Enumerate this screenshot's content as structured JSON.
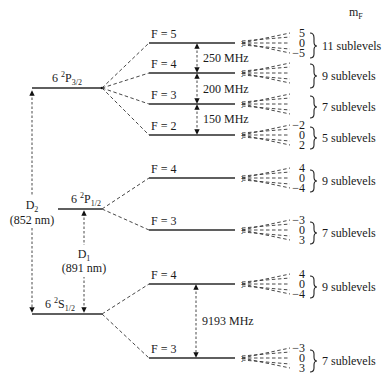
{
  "diagram": {
    "mf_header": "m",
    "mf_header_sub": "F",
    "fine_levels": {
      "p32": {
        "n": "6",
        "sup": "2",
        "L": "P",
        "sub": "3/2"
      },
      "p12": {
        "n": "6",
        "sup": "2",
        "L": "P",
        "sub": "1/2"
      },
      "s12": {
        "n": "6",
        "sup": "2",
        "L": "S",
        "sub": "1/2"
      }
    },
    "transitions": {
      "d2": {
        "label": "D",
        "sub": "2",
        "wavelength": "(852 nm)"
      },
      "d1": {
        "label": "D",
        "sub": "1",
        "wavelength": "(891 nm)"
      }
    },
    "splittings": {
      "p32_54": "250 MHz",
      "p32_43": "200 MHz",
      "p32_32": "150 MHz",
      "s12_43": "9193 MHz"
    },
    "hyperfine": [
      {
        "id": "p32_f5",
        "label": "F = 5",
        "mf": [
          "5",
          "0",
          "−5"
        ],
        "sublevels": "11 sublevels"
      },
      {
        "id": "p32_f4",
        "label": "F = 4",
        "mf": [
          "",
          "",
          ""
        ],
        "sublevels": "9 sublevels"
      },
      {
        "id": "p32_f3",
        "label": "F = 3",
        "mf": [
          "",
          "",
          ""
        ],
        "sublevels": "7 sublevels"
      },
      {
        "id": "p32_f2",
        "label": "F = 2",
        "mf": [
          "−2",
          "0",
          "2"
        ],
        "sublevels": "5 sublevels"
      },
      {
        "id": "p12_f4",
        "label": "F = 4",
        "mf": [
          "4",
          "0",
          "−4"
        ],
        "sublevels": "9 sublevels"
      },
      {
        "id": "p12_f3",
        "label": "F = 3",
        "mf": [
          "−3",
          "0",
          "3"
        ],
        "sublevels": "7 sublevels"
      },
      {
        "id": "s12_f4",
        "label": "F = 4",
        "mf": [
          "4",
          "0",
          "−4"
        ],
        "sublevels": "9 sublevels"
      },
      {
        "id": "s12_f3",
        "label": "F = 3",
        "mf": [
          "−3",
          "0",
          "3"
        ],
        "sublevels": "7 sublevels"
      }
    ]
  }
}
